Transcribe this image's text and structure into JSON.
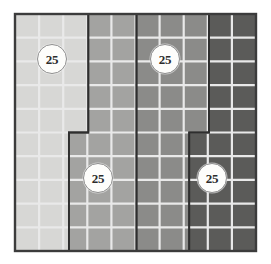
{
  "figure": {
    "grid": {
      "columns": 10,
      "rows": 10,
      "total_cells": 100,
      "origin_x": 15,
      "origin_y": 14,
      "cell_width": 24.1,
      "cell_height": 23.7,
      "gridline_color": "#e9e9e9",
      "outer_border_color": "#3c3c3c",
      "region_border_color": "#2e2e2e",
      "background": "#ffffff"
    },
    "regions": [
      {
        "id": "region-1",
        "label": "25",
        "cell_count": 25,
        "fill": "#d7d7d5",
        "description": "leftmost light region, three columns wide at top, narrowing near the middle",
        "path": "M 15 14 L 88.3 14 L 88.3 132.5 L 68.9 132.5 L 68.9 251 L 15 251 Z",
        "badge": {
          "x": 37,
          "y": 44,
          "text": "25"
        }
      },
      {
        "id": "region-2",
        "label": "25",
        "cell_count": 25,
        "fill": "#a3a3a1",
        "description": "second region, stepped: starts right of region one and ends at the central vertical boundary",
        "path": "M 88.3 14 L 136.5 14 L 136.5 251 L 68.9 251 L 68.9 132.5 L 88.3 132.5 Z",
        "badge": {
          "x": 83,
          "y": 163,
          "text": "25"
        }
      },
      {
        "id": "region-3",
        "label": "25",
        "cell_count": 25,
        "fill": "#8b8b89",
        "description": "third region, stepped: spans from the central boundary to the right boundary",
        "path": "M 136.5 14 L 208.9 14 L 208.9 132.5 L 189.2 132.5 L 189.2 251 L 136.5 251 Z",
        "badge": {
          "x": 150,
          "y": 44,
          "text": "25"
        }
      },
      {
        "id": "region-4",
        "label": "25",
        "cell_count": 25,
        "fill": "#5b5b59",
        "description": "rightmost dark region, two columns at top widening below the step",
        "path": "M 208.9 14 L 256 14 L 256 251 L 189.2 251 L 189.2 132.5 L 208.9 132.5 Z",
        "badge": {
          "x": 197,
          "y": 163,
          "text": "25"
        }
      }
    ],
    "gridlines": {
      "vertical_x": [
        39.1,
        63.2,
        87.3,
        111.4,
        135.5,
        159.6,
        183.7,
        207.8,
        231.9
      ],
      "horizontal_y": [
        37.7,
        61.4,
        85.1,
        108.8,
        132.5,
        156.2,
        179.9,
        203.6,
        227.3
      ]
    }
  }
}
